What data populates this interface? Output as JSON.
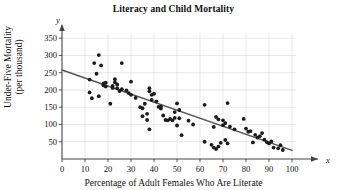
{
  "chart_data": {
    "type": "scatter",
    "title": "Literacy and Child Mortality",
    "xlabel": "Percentage of Adult Females Who Are Literate",
    "ylabel_line1": "Under-Five Mortality",
    "ylabel_line2": "(per thousand)",
    "x_axis_name": "x",
    "y_axis_name": "y",
    "xlim": [
      0,
      100
    ],
    "ylim": [
      0,
      365
    ],
    "xticks": [
      0,
      10,
      20,
      30,
      40,
      50,
      60,
      70,
      80,
      90,
      100
    ],
    "yticks": [
      50,
      100,
      150,
      200,
      250,
      300,
      350
    ],
    "grid": true,
    "legend": "none",
    "point_color": "#1b1b1b",
    "line_color": "#555555",
    "grid_color": "#d8d8d8",
    "axis_color": "#444444",
    "trendline": {
      "label": "least-squares regression line",
      "x0": 0,
      "y0": 258,
      "x1": 100,
      "y1": 25
    },
    "points": [
      [
        12,
        230
      ],
      [
        12,
        193
      ],
      [
        13,
        176
      ],
      [
        14,
        278
      ],
      [
        15,
        247
      ],
      [
        16,
        301
      ],
      [
        16,
        182
      ],
      [
        17,
        271
      ],
      [
        18,
        219
      ],
      [
        18,
        213
      ],
      [
        19,
        221
      ],
      [
        19,
        210
      ],
      [
        21,
        160
      ],
      [
        22,
        206
      ],
      [
        22,
        212
      ],
      [
        23,
        231
      ],
      [
        23,
        222
      ],
      [
        24,
        216
      ],
      [
        24,
        205
      ],
      [
        25,
        197
      ],
      [
        26,
        278
      ],
      [
        26,
        202
      ],
      [
        28,
        199
      ],
      [
        29,
        191
      ],
      [
        30,
        224
      ],
      [
        30,
        186
      ],
      [
        32,
        177
      ],
      [
        34,
        150
      ],
      [
        35,
        147
      ],
      [
        35,
        124
      ],
      [
        36,
        160
      ],
      [
        37,
        131
      ],
      [
        37,
        113
      ],
      [
        38,
        205
      ],
      [
        38,
        196
      ],
      [
        38,
        86
      ],
      [
        39,
        186
      ],
      [
        39,
        171
      ],
      [
        40,
        189
      ],
      [
        41,
        167
      ],
      [
        42,
        151
      ],
      [
        43,
        146
      ],
      [
        43,
        152
      ],
      [
        44,
        126
      ],
      [
        45,
        113
      ],
      [
        46,
        112
      ],
      [
        47,
        116
      ],
      [
        48,
        112
      ],
      [
        49,
        136
      ],
      [
        49,
        119
      ],
      [
        50,
        161
      ],
      [
        50,
        97
      ],
      [
        51,
        142
      ],
      [
        51,
        118
      ],
      [
        52,
        69
      ],
      [
        55,
        111
      ],
      [
        57,
        100
      ],
      [
        62,
        157
      ],
      [
        62,
        50
      ],
      [
        65,
        41
      ],
      [
        66,
        93
      ],
      [
        66,
        33
      ],
      [
        67,
        122
      ],
      [
        67,
        29
      ],
      [
        68,
        115
      ],
      [
        68,
        36
      ],
      [
        69,
        47
      ],
      [
        70,
        98
      ],
      [
        70,
        112
      ],
      [
        71,
        104
      ],
      [
        71,
        55
      ],
      [
        72,
        162
      ],
      [
        72,
        45
      ],
      [
        73,
        94
      ],
      [
        75,
        86
      ],
      [
        79,
        116
      ],
      [
        80,
        88
      ],
      [
        81,
        79
      ],
      [
        82,
        81
      ],
      [
        83,
        48
      ],
      [
        84,
        70
      ],
      [
        85,
        62
      ],
      [
        86,
        66
      ],
      [
        87,
        75
      ],
      [
        88,
        56
      ],
      [
        89,
        49
      ],
      [
        90,
        45
      ],
      [
        91,
        51
      ],
      [
        92,
        33
      ],
      [
        94,
        31
      ],
      [
        95,
        40
      ],
      [
        96,
        26
      ]
    ]
  }
}
